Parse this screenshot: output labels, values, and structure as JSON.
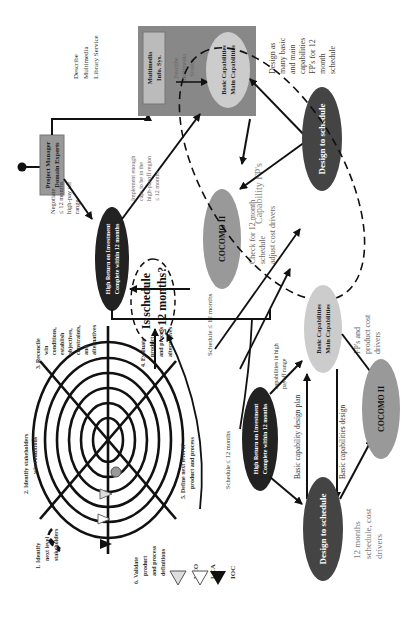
{
  "diagram": {
    "spiral": {
      "steps": [
        {
          "lines": [
            "1.  Identify",
            "next level",
            "stakeholders"
          ]
        },
        {
          "lines": [
            "2. Identify stakeholders",
            "win conditions"
          ]
        },
        {
          "lines": [
            "3. Reconcile",
            "win",
            "conditions,",
            "establish",
            "objectives,",
            "constraints,",
            "and",
            "alternatives"
          ]
        },
        {
          "lines": [
            "4. Evaluate",
            "product",
            "and process",
            "alternatives"
          ]
        },
        {
          "lines": [
            "5. Define next level of",
            "product and process"
          ]
        },
        {
          "lines": [
            "6. Validate",
            "product",
            "and process",
            "definitions"
          ]
        }
      ]
    },
    "legend": [
      {
        "symbol": "light-gray-triangle",
        "label": "LCO"
      },
      {
        "symbol": "white-triangle",
        "label": "LCA"
      },
      {
        "symbol": "black-triangle",
        "label": "IOC"
      }
    ],
    "top_flow": {
      "project_manager": [
        "Project Manager",
        "Domain Experts"
      ],
      "describe_service": [
        "Describe",
        "Multimedia",
        "Library Service"
      ],
      "multimedia_box": [
        "Multimedia",
        "Info. Sys."
      ],
      "describe_system": [
        "Describe",
        "Multimedia",
        "System"
      ],
      "basic_caps": [
        "Basic Capabilities",
        "Main Capabilities"
      ],
      "negotiate": [
        "Negotiate",
        "≤ 12 months",
        "high-pay off",
        "range"
      ],
      "hri": [
        "High Return on Investment",
        "Complete within 12 months"
      ],
      "implement": [
        "Implement  enough",
        "caps to be in the",
        "high-payoff region",
        "≤ 12 months"
      ],
      "is_schedule": [
        "Is schedule",
        "≤ 12 months?"
      ],
      "capability_fps": "Capability FP's",
      "cocomo": "COCOMO II",
      "check": [
        "Check for 12 month",
        "schedule",
        "adjust cost drivers"
      ],
      "design_to_schedule": "Design to schedule",
      "design_as_many": [
        "Design as",
        "many basic",
        "and main",
        "capabilities",
        "FP's for 12",
        "month",
        "schedule"
      ],
      "schedule_12": "Schedule ≤ 12 months"
    },
    "bottom_flow": {
      "hri": [
        "High Return on Investment",
        "Complete within 12 months"
      ],
      "caps_high": [
        "capabilities in high",
        "payoff range"
      ],
      "basic_caps": [
        "Basic Capabilities",
        "Main Capabilities"
      ],
      "fps_cost": [
        "FP's and",
        "product cost",
        "drivers"
      ],
      "schedule_12": "Schedule ≤ 12 months",
      "design_plan": "Basic capability design plan",
      "caps_design": "Basic capabilities design",
      "design_to_schedule": "Design to schedule",
      "cocomo": "COCOMO II",
      "twelve_months": [
        "12 months",
        "schedule, cost",
        "drivers"
      ]
    }
  }
}
